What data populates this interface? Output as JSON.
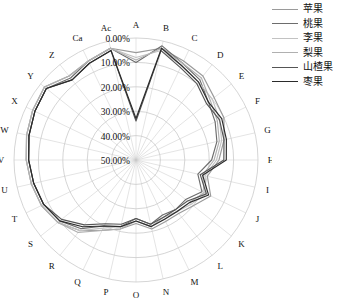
{
  "chart_data": {
    "type": "radar",
    "title": "",
    "xlabel": "",
    "ylabel": "",
    "grid": true,
    "legend_position": "right",
    "rlim": [
      0,
      50
    ],
    "r_unit": "%",
    "r_ticks": [
      "0.00%",
      "10.00%",
      "20.00%",
      "30.00%",
      "40.00%",
      "50.00%"
    ],
    "r_tick_values": [
      0,
      10,
      20,
      30,
      40,
      50
    ],
    "r_direction": "outward-to-inward",
    "categories": [
      "A",
      "B",
      "C",
      "D",
      "E",
      "F",
      "G",
      "H",
      "I",
      "J",
      "K",
      "L",
      "M",
      "N",
      "O",
      "P",
      "Q",
      "R",
      "S",
      "T",
      "U",
      "V",
      "W",
      "X",
      "Y",
      "Z",
      "Ca",
      "Ac"
    ],
    "series": [
      {
        "name": "苹果",
        "color": "#9a9a9a",
        "values": [
          6,
          3,
          5,
          6,
          9,
          10,
          13,
          16,
          20,
          16,
          20,
          22,
          22,
          21,
          24,
          21,
          18,
          13,
          9,
          7,
          6,
          5,
          4,
          3,
          2,
          6,
          5,
          3
        ]
      },
      {
        "name": "桃果",
        "color": "#6d6d6d",
        "values": [
          10,
          2,
          6,
          8,
          12,
          14,
          16,
          19,
          24,
          20,
          24,
          24,
          25,
          23,
          26,
          22,
          20,
          14,
          10,
          8,
          7,
          6,
          5,
          4,
          3,
          7,
          5,
          3
        ]
      },
      {
        "name": "李果",
        "color": "#c2c2c2",
        "values": [
          8,
          4,
          7,
          9,
          10,
          12,
          14,
          17,
          21,
          18,
          21,
          23,
          23,
          22,
          25,
          22,
          19,
          13,
          9,
          7,
          6,
          5,
          4,
          3,
          2,
          6,
          5,
          3
        ]
      },
      {
        "name": "梨果",
        "color": "#b0b0b0",
        "values": [
          9,
          3,
          6,
          7,
          11,
          13,
          15,
          18,
          22,
          19,
          22,
          23,
          24,
          22,
          25,
          21,
          18,
          12,
          9,
          7,
          6,
          5,
          4,
          3,
          2,
          6,
          5,
          3
        ]
      },
      {
        "name": "山楂果",
        "color": "#555555",
        "values": [
          34,
          4,
          8,
          10,
          13,
          12,
          13,
          14,
          23,
          18,
          23,
          24,
          24,
          23,
          26,
          23,
          21,
          16,
          11,
          8,
          7,
          6,
          5,
          4,
          3,
          8,
          6,
          4
        ]
      },
      {
        "name": "枣果",
        "color": "#2b2b2b",
        "values": [
          33,
          3,
          7,
          9,
          12,
          11,
          12,
          13,
          22,
          17,
          22,
          23,
          23,
          22,
          25,
          22,
          20,
          15,
          10,
          8,
          7,
          6,
          5,
          4,
          3,
          8,
          6,
          4
        ]
      }
    ]
  },
  "legend": {
    "items": [
      {
        "label": "苹果"
      },
      {
        "label": "桃果"
      },
      {
        "label": "李果"
      },
      {
        "label": "梨果"
      },
      {
        "label": "山楂果"
      },
      {
        "label": "枣果"
      }
    ]
  }
}
